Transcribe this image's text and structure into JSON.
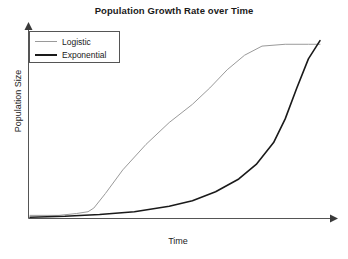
{
  "chart_data": {
    "type": "line",
    "title": "Population Growth Rate over Time",
    "xlabel": "Time",
    "ylabel": "Population Size",
    "grid": false,
    "legend_position": "top-left",
    "xlim": [
      0,
      100
    ],
    "ylim": [
      0,
      100
    ],
    "axis_ticks": false,
    "axes_style": "arrowed-L",
    "series": [
      {
        "name": "Logistic",
        "color": "#9a9a9a",
        "width": 1,
        "x": [
          0,
          10,
          16,
          20,
          22,
          26,
          32,
          40,
          48,
          56,
          62,
          68,
          74,
          80,
          88,
          96,
          100
        ],
        "y": [
          2,
          2,
          3,
          4,
          6,
          14,
          27,
          41,
          53,
          63,
          72,
          82,
          90,
          95,
          96,
          96,
          96
        ]
      },
      {
        "name": "Exponential",
        "color": "#1a1a1a",
        "width": 1.6,
        "x": [
          0,
          12,
          24,
          36,
          48,
          56,
          64,
          72,
          78,
          84,
          88,
          92,
          96,
          100
        ],
        "y": [
          1,
          1.5,
          2.5,
          4,
          7,
          10,
          15,
          22,
          30,
          42,
          55,
          72,
          88,
          98
        ]
      }
    ]
  },
  "legend": {
    "items": [
      {
        "label": "Logistic"
      },
      {
        "label": "Exponential"
      }
    ]
  }
}
